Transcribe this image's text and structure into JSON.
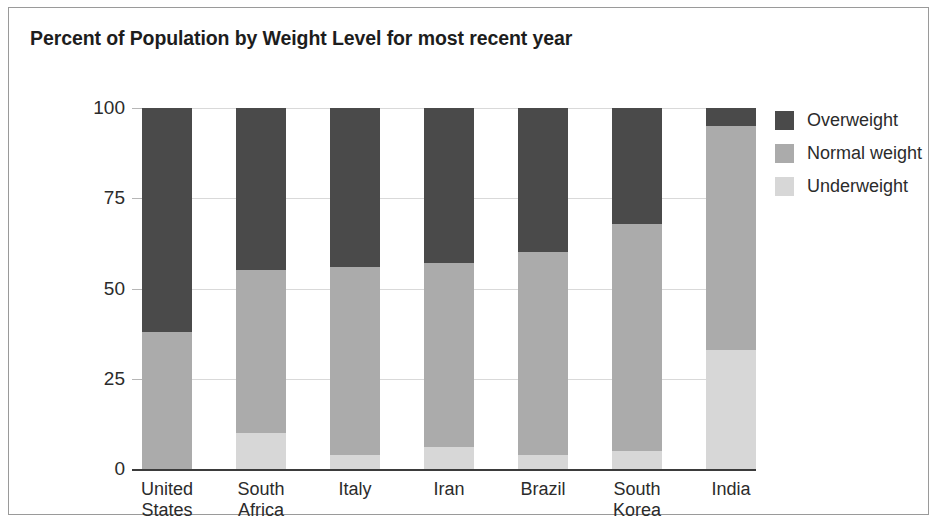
{
  "chart_data": {
    "type": "bar",
    "subtype": "stacked-bar-100",
    "title": "Percent of Population by Weight Level for most recent year",
    "xlabel": "",
    "ylabel": "",
    "ylim": [
      0,
      100
    ],
    "yticks": [
      0,
      25,
      50,
      75,
      100
    ],
    "ytick_labels": [
      "0",
      "25",
      "50",
      "75",
      "100"
    ],
    "grid": true,
    "legend_position": "right",
    "categories": [
      "United\nStates",
      "South\nAfrica",
      "Italy",
      "Iran",
      "Brazil",
      "South\nKorea",
      "India"
    ],
    "series": [
      {
        "name": "Overweight",
        "color": "#4a4a4a",
        "values": [
          62,
          45,
          44,
          43,
          40,
          32,
          5
        ]
      },
      {
        "name": "Normal weight",
        "color": "#ababab",
        "values": [
          38,
          45,
          52,
          51,
          56,
          63,
          62
        ]
      },
      {
        "name": "Underweight",
        "color": "#d7d7d7",
        "values": [
          0,
          10,
          4,
          6,
          4,
          5,
          33
        ]
      }
    ]
  },
  "legend": {
    "items": [
      {
        "label": "Overweight",
        "color": "#4a4a4a"
      },
      {
        "label": "Normal weight",
        "color": "#ababab"
      },
      {
        "label": "Underweight",
        "color": "#d7d7d7"
      }
    ]
  }
}
